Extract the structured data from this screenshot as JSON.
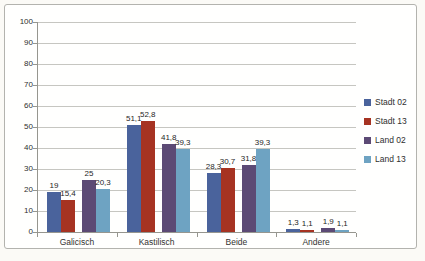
{
  "chart_data": {
    "type": "bar",
    "title": "",
    "xlabel": "",
    "ylabel": "",
    "categories": [
      "Galicisch",
      "Kastilisch",
      "Beide",
      "Andere"
    ],
    "series": [
      {
        "name": "Stadt 02",
        "color": "#4a639c",
        "values": [
          19,
          51.1,
          28.3,
          1.3
        ],
        "value_labels": [
          "19",
          "51,1",
          "28,3",
          "1,3"
        ]
      },
      {
        "name": "Stadt 13",
        "color": "#a63322",
        "values": [
          15.4,
          52.8,
          30.7,
          1.1
        ],
        "value_labels": [
          "15,4",
          "52,8",
          "30,7",
          "1,1"
        ]
      },
      {
        "name": "Land 02",
        "color": "#5c4a75",
        "values": [
          25,
          41.8,
          31.8,
          1.9
        ],
        "value_labels": [
          "25",
          "41,8",
          "31,8",
          "1,9"
        ]
      },
      {
        "name": "Land 13",
        "color": "#6ea3c2",
        "values": [
          20.3,
          39.3,
          39.3,
          1.1
        ],
        "value_labels": [
          "20,3",
          "39,3",
          "39,3",
          "1,1"
        ]
      }
    ],
    "ylim": [
      0,
      100
    ],
    "ytick_step": 10,
    "ytick_labels": [
      "0",
      "10",
      "20",
      "30",
      "40",
      "50",
      "60",
      "70",
      "80",
      "90",
      "100"
    ],
    "grid": true,
    "legend_position": "right",
    "legend": [
      "Stadt 02",
      "Stadt 13",
      "Land 02",
      "Land 13"
    ],
    "value_labels_shown": true,
    "decimal_separator": ","
  },
  "colors": {
    "page_background": "#fbfaf6",
    "plot_background": "#fffffe",
    "frame_border": "#b3b3ae",
    "gridline": "#c6c6c1",
    "axis": "#96968f",
    "text": "#2f2f2f"
  }
}
